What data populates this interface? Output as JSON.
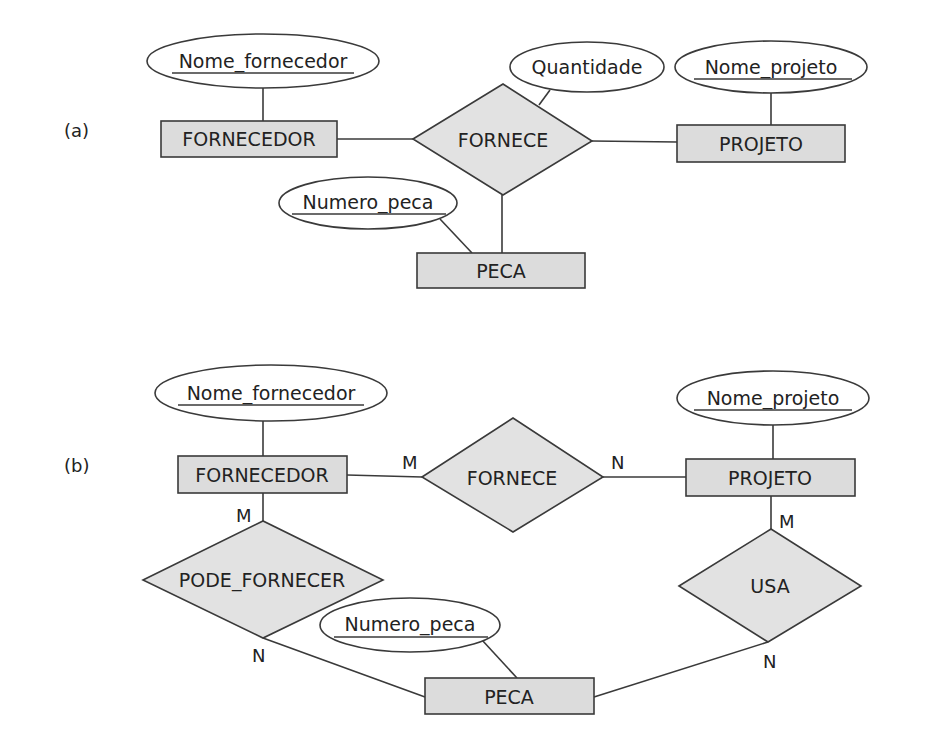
{
  "diagram_a": {
    "part_label": "(a)",
    "entities": {
      "fornecedor": "FORNECEDOR",
      "projeto": "PROJETO",
      "peca": "PECA"
    },
    "relationships": {
      "fornece": "FORNECE"
    },
    "attributes": {
      "nome_fornecedor": "Nome_fornecedor",
      "quantidade": "Quantidade",
      "nome_projeto": "Nome_projeto",
      "numero_peca": "Numero_peca"
    }
  },
  "diagram_b": {
    "part_label": "(b)",
    "entities": {
      "fornecedor": "FORNECEDOR",
      "projeto": "PROJETO",
      "peca": "PECA"
    },
    "relationships": {
      "fornece": "FORNECE",
      "pode_fornecer": "PODE_FORNECER",
      "usa": "USA"
    },
    "attributes": {
      "nome_fornecedor": "Nome_fornecedor",
      "nome_projeto": "Nome_projeto",
      "numero_peca": "Numero_peca"
    },
    "cardinalities": {
      "fornecedor_fornece": "M",
      "fornece_projeto": "N",
      "fornecedor_pode_fornecer": "M",
      "pode_fornecer_peca": "N",
      "projeto_usa": "M",
      "usa_peca": "N"
    }
  },
  "colors": {
    "entity_fill": "#dcdcdc",
    "relationship_fill": "#e2e2e2",
    "stroke": "#3a3a3a",
    "text": "#222222"
  }
}
